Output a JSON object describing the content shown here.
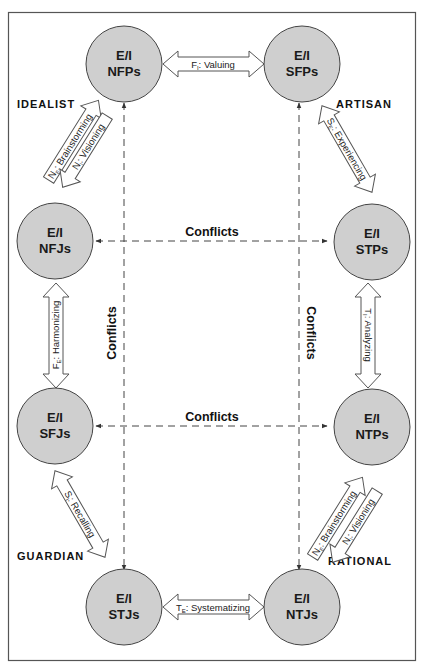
{
  "colors": {
    "circle_fill": "#cfcfcf",
    "circle_stroke": "#444444",
    "frame": "#555555",
    "arrow_stroke": "#555555",
    "dash": "#444444"
  },
  "temperaments": {
    "idealist": "IDEALIST",
    "artisan": "ARTISAN",
    "guardian": "GUARDIAN",
    "rational": "RATIONAL"
  },
  "nodes": [
    {
      "id": "nfps",
      "line1": "E/I",
      "line2": "NFPs"
    },
    {
      "id": "sfps",
      "line1": "E/I",
      "line2": "SFPs"
    },
    {
      "id": "nfjs",
      "line1": "E/I",
      "line2": "NFJs"
    },
    {
      "id": "stps",
      "line1": "E/I",
      "line2": "STPs"
    },
    {
      "id": "sfjs",
      "line1": "E/I",
      "line2": "SFJs"
    },
    {
      "id": "ntps",
      "line1": "E/I",
      "line2": "NTPs"
    },
    {
      "id": "stjs",
      "line1": "E/I",
      "line2": "STJs"
    },
    {
      "id": "ntjs",
      "line1": "E/I",
      "line2": "NTJs"
    }
  ],
  "links": {
    "valuing": {
      "sym": "F",
      "sub": "I",
      "text": ": Valuing"
    },
    "systematizing": {
      "sym": "T",
      "sub": "E",
      "text": ": Systematizing"
    },
    "harmonizing": {
      "sym": "F",
      "sub": "E",
      "text": ": Harmonizing"
    },
    "analyzing": {
      "sym": "T",
      "sub": "I",
      "text": ": Analyzing"
    },
    "experiencing": {
      "sym": "S",
      "sub": "E",
      "text": ": Experiencing"
    },
    "recalling": {
      "sym": "S",
      "sub": "I",
      "text": ": Recalling"
    },
    "idealist_brainstorming": {
      "sym": "N",
      "sub": "E",
      "text": ": Brainstorming"
    },
    "idealist_visioning": {
      "sym": "N",
      "sub": "I",
      "text": ": Visioning"
    },
    "rational_brainstorming": {
      "sym": "N",
      "sub": "E",
      "text": ": Brainstorming"
    },
    "rational_visioning": {
      "sym": "N",
      "sub": "I",
      "text": ": Visioning"
    }
  },
  "conflicts": {
    "top_horizontal": "Conflicts",
    "bottom_horizontal": "Conflicts",
    "left_vertical": "Conflicts",
    "right_vertical": "Conflicts"
  }
}
